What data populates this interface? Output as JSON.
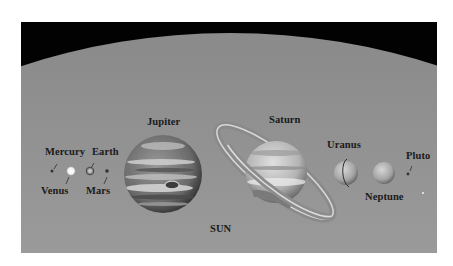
{
  "figure": {
    "type": "solar-system-size-comparison",
    "background_colors": {
      "space": "#020202",
      "sun_top": "#8c8c8c",
      "sun_bottom": "#dcdcdc",
      "page": "#ffffff"
    }
  },
  "labels": {
    "sun": "SUN",
    "mercury": "Mercury",
    "venus": "Venus",
    "earth": "Earth",
    "mars": "Mars",
    "jupiter": "Jupiter",
    "saturn": "Saturn",
    "uranus": "Uranus",
    "neptune": "Neptune",
    "pluto": "Pluto"
  },
  "bodies": [
    {
      "name": "Mercury",
      "cx": 31,
      "cy": 149,
      "r": 1.5
    },
    {
      "name": "Venus",
      "cx": 50,
      "cy": 149,
      "r": 4
    },
    {
      "name": "Earth",
      "cx": 69,
      "cy": 149,
      "r": 4
    },
    {
      "name": "Mars",
      "cx": 86,
      "cy": 149,
      "r": 1.8
    },
    {
      "name": "Jupiter",
      "cx": 142,
      "cy": 152,
      "r": 39
    },
    {
      "name": "Saturn",
      "cx": 255,
      "cy": 150,
      "r": 31
    },
    {
      "name": "Uranus",
      "cx": 325,
      "cy": 151,
      "r": 12
    },
    {
      "name": "Neptune",
      "cx": 363,
      "cy": 151,
      "r": 11
    },
    {
      "name": "Pluto",
      "cx": 387,
      "cy": 152,
      "r": 1.4
    }
  ]
}
